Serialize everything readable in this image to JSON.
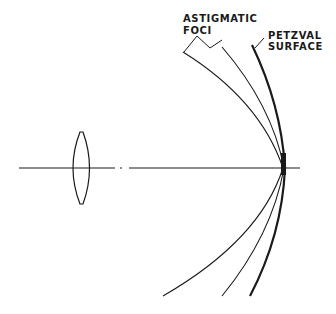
{
  "diagram": {
    "labels": {
      "astigmatic_line1": "ASTIGMATIC",
      "astigmatic_line2": "FOCI",
      "petzval_line1": "PETZVAL",
      "petzval_line2": "SURFACE"
    },
    "elements": [
      {
        "name": "optical-axis",
        "type": "line",
        "style": "dash-dot"
      },
      {
        "name": "biconvex-lens",
        "type": "shape"
      },
      {
        "name": "tangential-focus-curve",
        "type": "curve"
      },
      {
        "name": "sagittal-focus-curve",
        "type": "curve"
      },
      {
        "name": "petzval-surface-curve",
        "type": "curve",
        "weight": "thick"
      }
    ],
    "colors": {
      "ink": "#1a1a1a",
      "background": "#ffffff"
    }
  }
}
